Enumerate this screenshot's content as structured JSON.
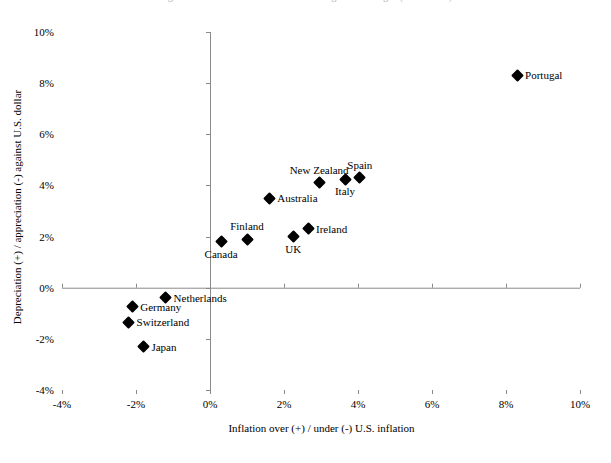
{
  "figure": {
    "top_caption": "Figure: Inflation differentials and exchange-rate changes (1996-2006)"
  },
  "chart_data": {
    "type": "scatter",
    "title": "",
    "xlabel": "Inflation over (+) / under (-) U.S. inflation",
    "ylabel": "Depreciation (+) / appreciation (-) against U.S. dollar",
    "xlim": [
      -4,
      10
    ],
    "ylim": [
      -4,
      10
    ],
    "xticks": [
      "-4%",
      "-2%",
      "0%",
      "2%",
      "4%",
      "6%",
      "8%",
      "10%"
    ],
    "xtick_values": [
      -4,
      -2,
      0,
      2,
      4,
      6,
      8,
      10
    ],
    "yticks": [
      "-4%",
      "-2%",
      "0%",
      "2%",
      "4%",
      "6%",
      "8%",
      "10%"
    ],
    "ytick_values": [
      -4,
      -2,
      0,
      2,
      4,
      6,
      8,
      10
    ],
    "grid": false,
    "legend": "none",
    "marker_shape": "diamond",
    "marker_color": "#000000",
    "points": [
      {
        "label": "Portugal",
        "x": 8.3,
        "y": 8.3,
        "label_pos": "right"
      },
      {
        "label": "Spain",
        "x": 4.05,
        "y": 4.3,
        "label_pos": "above"
      },
      {
        "label": "Italy",
        "x": 3.65,
        "y": 4.25,
        "label_pos": "below"
      },
      {
        "label": "New Zealand",
        "x": 2.95,
        "y": 4.1,
        "label_pos": "above"
      },
      {
        "label": "Australia",
        "x": 1.6,
        "y": 3.5,
        "label_pos": "right"
      },
      {
        "label": "Ireland",
        "x": 2.65,
        "y": 2.3,
        "label_pos": "right"
      },
      {
        "label": "UK",
        "x": 2.25,
        "y": 2.0,
        "label_pos": "below"
      },
      {
        "label": "Finland",
        "x": 1.0,
        "y": 1.9,
        "label_pos": "above"
      },
      {
        "label": "Canada",
        "x": 0.3,
        "y": 1.8,
        "label_pos": "below"
      },
      {
        "label": "Netherlands",
        "x": -1.2,
        "y": -0.4,
        "label_pos": "right"
      },
      {
        "label": "Germany",
        "x": -2.1,
        "y": -0.75,
        "label_pos": "right"
      },
      {
        "label": "Switzerland",
        "x": -2.2,
        "y": -1.35,
        "label_pos": "right"
      },
      {
        "label": "Japan",
        "x": -1.8,
        "y": -2.3,
        "label_pos": "right"
      }
    ]
  }
}
